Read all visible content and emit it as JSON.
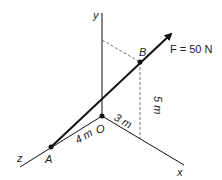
{
  "diagram": {
    "axes": {
      "x_label": "x",
      "y_label": "y",
      "z_label": "z"
    },
    "points": {
      "origin": "O",
      "a": "A",
      "b": "B"
    },
    "force_label": "F = 50 N",
    "dimensions": {
      "z_distance": "4 m",
      "x_distance": "3 m",
      "height": "5 m"
    },
    "colors": {
      "line": "#111111",
      "dashed": "#555555"
    }
  }
}
